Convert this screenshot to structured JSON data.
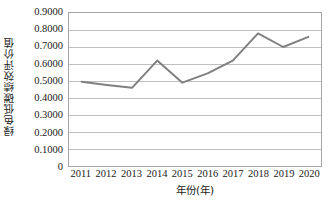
{
  "chart_data": {
    "type": "line",
    "title": "",
    "xlabel": "年份(年)",
    "ylabel": "绿色低碳绩效评价值",
    "categories": [
      "2011",
      "2012",
      "2013",
      "2014",
      "2015",
      "2016",
      "2017",
      "2018",
      "2019",
      "2020"
    ],
    "values": [
      0.495,
      0.477,
      0.46,
      0.62,
      0.49,
      0.545,
      0.62,
      0.78,
      0.7,
      0.76
    ],
    "series": [
      {
        "name": "绿色低碳绩效评价值",
        "values": [
          0.495,
          0.477,
          0.46,
          0.62,
          0.49,
          0.545,
          0.62,
          0.78,
          0.7,
          0.76
        ]
      }
    ],
    "ylim": [
      0,
      0.9
    ],
    "ytick_labels": [
      "0.9000",
      "0.8000",
      "0.7000",
      "0.6000",
      "0.5000",
      "0.4000",
      "0.3000",
      "0.2000",
      "0.1000",
      "0"
    ],
    "ytick_values": [
      0.9,
      0.8,
      0.7,
      0.6,
      0.5,
      0.4,
      0.3,
      0.2,
      0.1,
      0
    ],
    "grid": "horizontal",
    "legend": "none",
    "line_color": "#808080",
    "gridline_color": "#bfbfbf",
    "border_color": "#a6a6a6",
    "plot_background": "#ffffff"
  }
}
